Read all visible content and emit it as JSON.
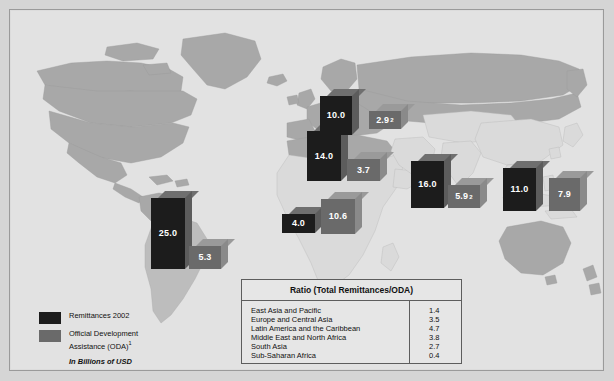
{
  "chart_data": {
    "type": "map",
    "title": "",
    "note": "In Billions of USD",
    "legend": [
      {
        "key": "remittances",
        "label": "Remittances 2002",
        "color": "#1c1c1c"
      },
      {
        "key": "oda",
        "label": "Official Development Assistance (ODA)",
        "sup": "1",
        "color": "#6a6a6a"
      }
    ],
    "series": [
      {
        "name": "Remittances 2002",
        "color": "#1c1c1c"
      },
      {
        "name": "Official Development Assistance (ODA)",
        "color": "#6a6a6a"
      }
    ],
    "markers": [
      {
        "region": "East Asia and Pacific",
        "type": "remittances",
        "value": "11.0",
        "sup": "",
        "x": 492,
        "y": 150,
        "w": 33,
        "h": 43
      },
      {
        "region": "East Asia and Pacific",
        "type": "oda",
        "value": "7.9",
        "sup": "",
        "x": 538,
        "y": 160,
        "w": 31,
        "h": 33
      },
      {
        "region": "Europe and Central Asia",
        "type": "remittances",
        "value": "14.0",
        "sup": "",
        "x": 296,
        "y": 113,
        "w": 34,
        "h": 50
      },
      {
        "region": "Europe and Central Asia",
        "type": "oda",
        "value": "3.7",
        "sup": "",
        "x": 336,
        "y": 141,
        "w": 33,
        "h": 22
      },
      {
        "region": "North America",
        "type": "remittances",
        "value": "10.0",
        "sup": "",
        "x": 309,
        "y": 78,
        "w": 32,
        "h": 39
      },
      {
        "region": "North America",
        "type": "oda",
        "value": "2.9",
        "sup": "2",
        "x": 358,
        "y": 93,
        "w": 32,
        "h": 18
      },
      {
        "region": "Latin America and the Caribbean",
        "type": "remittances",
        "value": "25.0",
        "sup": "",
        "x": 140,
        "y": 180,
        "w": 34,
        "h": 71
      },
      {
        "region": "Latin America and the Caribbean",
        "type": "oda",
        "value": "5.3",
        "sup": "",
        "x": 178,
        "y": 228,
        "w": 32,
        "h": 23
      },
      {
        "region": "Sub-Saharan Africa",
        "type": "remittances",
        "value": "4.0",
        "sup": "",
        "x": 271,
        "y": 196,
        "w": 33,
        "h": 19
      },
      {
        "region": "Sub-Saharan Africa",
        "type": "oda",
        "value": "10.6",
        "sup": "",
        "x": 310,
        "y": 181,
        "w": 34,
        "h": 35
      },
      {
        "region": "South Asia",
        "type": "remittances",
        "value": "16.0",
        "sup": "",
        "x": 400,
        "y": 143,
        "w": 33,
        "h": 47
      },
      {
        "region": "South Asia",
        "type": "oda",
        "value": "5.9",
        "sup": "2",
        "x": 437,
        "y": 167,
        "w": 32,
        "h": 23
      }
    ],
    "ratio_table": {
      "title": "Ratio (Total Remittances/ODA)",
      "columns": [
        "Region",
        "Ratio"
      ],
      "rows": [
        {
          "label": "East Asia and Pacific",
          "value": "1.4"
        },
        {
          "label": "Europe and Central Asia",
          "value": "3.5"
        },
        {
          "label": "Latin America and the Caribbean",
          "value": "4.7"
        },
        {
          "label": "Middle East and North Africa",
          "value": "3.8"
        },
        {
          "label": "South Asia",
          "value": "2.7"
        },
        {
          "label": "Sub-Saharan Africa",
          "value": "0.4"
        }
      ],
      "categories": [
        "East Asia and Pacific",
        "Europe and Central Asia",
        "Latin America and the Caribbean",
        "Middle East and North Africa",
        "South Asia",
        "Sub-Saharan Africa"
      ],
      "values": [
        1.4,
        3.5,
        4.7,
        3.8,
        2.7,
        0.4
      ]
    }
  },
  "legend": {
    "remittances_label": "Remittances 2002",
    "oda_label_line1": "Official Development",
    "oda_label_line2": "Assistance (ODA)",
    "oda_sup": "1",
    "units_note": "In Billions of USD"
  },
  "ratio_table": {
    "title": "Ratio (Total Remittances/ODA)"
  },
  "colors": {
    "background": "#d5d5d5",
    "plate": "#e2e2e2",
    "land_dark": "#a8a8a8",
    "land_light": "#dadada",
    "remittances": "#1c1c1c",
    "oda": "#6a6a6a",
    "frame": "#9a9a9a"
  }
}
